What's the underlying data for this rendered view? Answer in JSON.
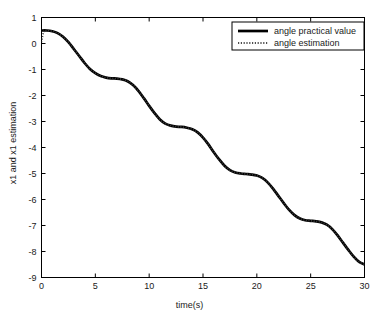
{
  "chart_data": {
    "type": "line",
    "title": "",
    "xlabel": "time(s)",
    "ylabel": "x1 and x1 estimation",
    "xlim": [
      0,
      30
    ],
    "ylim": [
      -9,
      1
    ],
    "xticks": [
      0,
      5,
      10,
      15,
      20,
      25,
      30
    ],
    "yticks": [
      1,
      0,
      -1,
      -2,
      -3,
      -4,
      -5,
      -6,
      -7,
      -8,
      -9
    ],
    "xtick_labels": [
      "0",
      "5",
      "10",
      "15",
      "20",
      "25",
      "30"
    ],
    "ytick_labels": [
      "1",
      "0",
      "-1",
      "-2",
      "-3",
      "-4",
      "-5",
      "-6",
      "-7",
      "-8",
      "-9"
    ],
    "grid": false,
    "legend_position": "upper right",
    "legend_entries": [
      {
        "name": "angle practical value",
        "style": "solid",
        "color": "#000000",
        "width": 2.6
      },
      {
        "name": "angle estimation",
        "style": "dotted",
        "color": "#4d4d4d",
        "width": 1.6
      }
    ],
    "series": [
      {
        "name": "angle practical value",
        "style": "solid",
        "color": "#000000",
        "x": [
          0,
          0.5,
          1,
          1.5,
          2,
          2.5,
          3,
          3.5,
          4,
          4.5,
          5,
          5.5,
          6,
          6.5,
          7,
          7.5,
          8,
          8.5,
          9,
          9.5,
          10,
          10.5,
          11,
          11.5,
          12,
          12.5,
          13,
          13.5,
          14,
          14.5,
          15,
          15.5,
          16,
          16.5,
          17,
          17.5,
          18,
          18.5,
          19,
          19.5,
          20,
          20.5,
          21,
          21.5,
          22,
          22.5,
          23,
          23.5,
          24,
          24.5,
          25,
          25.5,
          26,
          26.5,
          27,
          27.5,
          28,
          28.5,
          29,
          29.5,
          30
        ],
        "y": [
          0.5,
          0.5,
          0.47,
          0.4,
          0.26,
          0.05,
          -0.21,
          -0.48,
          -0.75,
          -0.98,
          -1.14,
          -1.25,
          -1.31,
          -1.34,
          -1.35,
          -1.38,
          -1.45,
          -1.6,
          -1.82,
          -2.1,
          -2.4,
          -2.68,
          -2.92,
          -3.08,
          -3.16,
          -3.2,
          -3.21,
          -3.24,
          -3.3,
          -3.42,
          -3.62,
          -3.88,
          -4.18,
          -4.46,
          -4.7,
          -4.87,
          -4.96,
          -5.0,
          -5.02,
          -5.04,
          -5.08,
          -5.17,
          -5.34,
          -5.58,
          -5.86,
          -6.14,
          -6.4,
          -6.6,
          -6.73,
          -6.8,
          -6.82,
          -6.84,
          -6.88,
          -6.97,
          -7.14,
          -7.38,
          -7.66,
          -7.94,
          -8.2,
          -8.4,
          -8.5
        ]
      },
      {
        "name": "angle estimation",
        "style": "dotted",
        "color": "#3a3a3a",
        "x": [
          0,
          0.1,
          0.2,
          0.3,
          0.5,
          1,
          1.5,
          2,
          2.5,
          3,
          3.5,
          4,
          4.5,
          5,
          5.5,
          6,
          6.5,
          7,
          7.5,
          8,
          8.5,
          9,
          9.5,
          10,
          10.5,
          11,
          11.5,
          12,
          12.5,
          13,
          13.5,
          14,
          14.5,
          15,
          15.5,
          16,
          16.5,
          17,
          17.5,
          18,
          18.5,
          19,
          19.5,
          20,
          20.5,
          21,
          21.5,
          22,
          22.5,
          23,
          23.5,
          24,
          24.5,
          25,
          25.5,
          26,
          26.5,
          27,
          27.5,
          28,
          28.5,
          29,
          29.5,
          30
        ],
        "y": [
          0.05,
          0.28,
          0.44,
          0.5,
          0.5,
          0.47,
          0.4,
          0.26,
          0.05,
          -0.21,
          -0.48,
          -0.75,
          -0.98,
          -1.14,
          -1.25,
          -1.31,
          -1.34,
          -1.35,
          -1.38,
          -1.45,
          -1.6,
          -1.82,
          -2.1,
          -2.4,
          -2.68,
          -2.92,
          -3.08,
          -3.16,
          -3.2,
          -3.21,
          -3.24,
          -3.3,
          -3.42,
          -3.62,
          -3.88,
          -4.18,
          -4.46,
          -4.7,
          -4.87,
          -4.96,
          -5.0,
          -5.02,
          -5.04,
          -5.08,
          -5.17,
          -5.34,
          -5.58,
          -5.86,
          -6.14,
          -6.4,
          -6.6,
          -6.73,
          -6.8,
          -6.82,
          -6.84,
          -6.88,
          -6.97,
          -7.14,
          -7.38,
          -7.66,
          -7.94,
          -8.2,
          -8.4,
          -8.5
        ]
      }
    ],
    "annotations": {
      "plateaus": [
        -1.35,
        -3.2,
        -5.0,
        -6.8
      ],
      "start_value": 0.5,
      "end_value": -8.5
    }
  }
}
